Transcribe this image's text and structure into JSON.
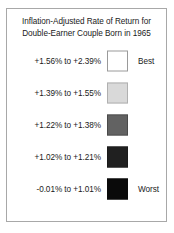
{
  "legend": {
    "title_line_1": "Inflation-Adjusted Rate of Return for",
    "title_line_2": "Double-Earner Couple Born in 1965",
    "rows": [
      {
        "range": "+1.56% to +2.39%",
        "qualifier": "Best",
        "swatch_color": "#ffffff",
        "tone": 0
      },
      {
        "range": "+1.39% to +1.55%",
        "qualifier": "",
        "swatch_color": "#d9d9d9",
        "tone": 1
      },
      {
        "range": "+1.22% to +1.38%",
        "qualifier": "",
        "swatch_color": "#6e6e6e",
        "tone": 2
      },
      {
        "range": "+1.02% to +1.21%",
        "qualifier": "",
        "swatch_color": "#2a2a2a",
        "tone": 3
      },
      {
        "range": "-0.01% to +1.01%",
        "qualifier": "Worst",
        "swatch_color": "#0a0a0a",
        "tone": 4
      }
    ],
    "border_color": "#a8a8a8",
    "text_color": "#1a1a1a"
  },
  "chart_data": {
    "type": "table",
    "title": "Inflation-Adjusted Rate of Return for Double-Earner Couple Born in 1965",
    "xlabel": "",
    "ylabel": "",
    "legend_position": "standalone",
    "grid": false,
    "categories": [
      "+1.56% to +2.39%",
      "+1.39% to +1.55%",
      "+1.22% to +1.38%",
      "+1.02% to +1.21%",
      "-0.01% to +1.01%"
    ],
    "bin_lower_bounds": [
      1.56,
      1.39,
      1.22,
      1.02,
      -0.01
    ],
    "bin_upper_bounds": [
      2.39,
      1.55,
      1.38,
      1.21,
      1.01
    ],
    "swatch_colors": [
      "#ffffff",
      "#d9d9d9",
      "#6e6e6e",
      "#2a2a2a",
      "#0a0a0a"
    ],
    "annotations": [
      "Best",
      "Worst"
    ],
    "value_range": [
      -0.01,
      2.39
    ],
    "units": "percent"
  }
}
